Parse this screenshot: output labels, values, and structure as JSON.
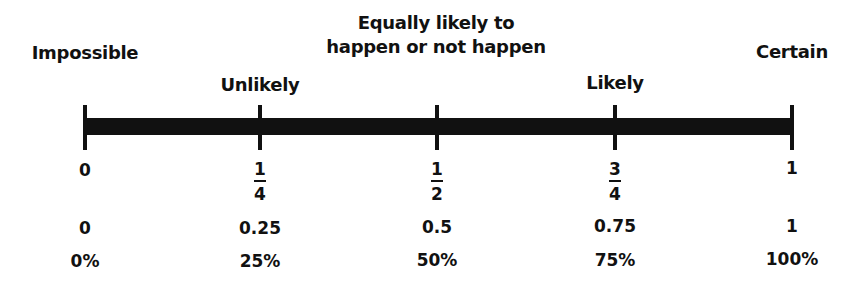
{
  "diagram": {
    "bar_color": "#111111",
    "labels": [
      {
        "text": "Impossible",
        "position": 0
      },
      {
        "text": "Unlikely",
        "position": 0.25
      },
      {
        "line1": "Equally likely to",
        "line2": "happen or not happen",
        "position": 0.5
      },
      {
        "text": "Likely",
        "position": 0.75
      },
      {
        "text": "Certain",
        "position": 1
      }
    ],
    "fractions": [
      {
        "whole": "0"
      },
      {
        "numerator": "1",
        "denominator": "4"
      },
      {
        "numerator": "1",
        "denominator": "2"
      },
      {
        "numerator": "3",
        "denominator": "4"
      },
      {
        "whole": "1"
      }
    ],
    "decimals": [
      "0",
      "0.25",
      "0.5",
      "0.75",
      "1"
    ],
    "percents": [
      "0%",
      "25%",
      "50%",
      "75%",
      "100%"
    ]
  }
}
